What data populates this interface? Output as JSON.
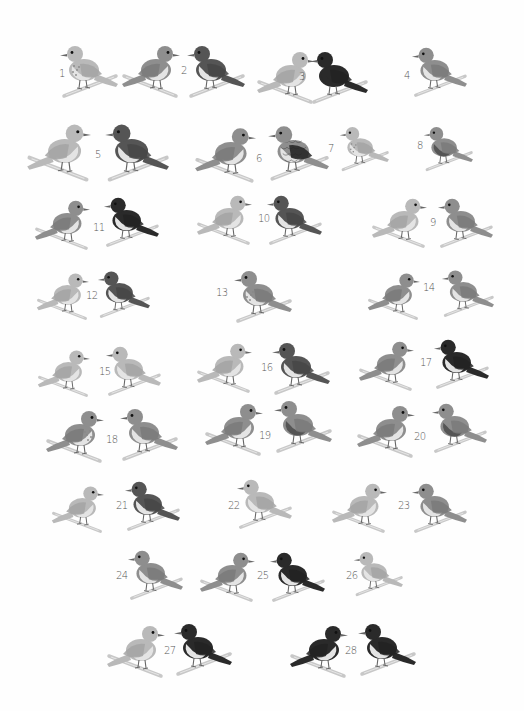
{
  "plate": {
    "description": "Illustration plate of small perching songbirds, numbered 1 to 28, grayscale",
    "background": "#fefefe",
    "shades": {
      "light": "#b9b9b9",
      "mid": "#8e8e8e",
      "dark": "#555555",
      "black": "#2a2a2a",
      "belly": "#e4e4e4",
      "branch": "#c8c8c8"
    }
  },
  "labels": [
    {
      "n": "1",
      "x": 59,
      "y": 68
    },
    {
      "n": "2",
      "x": 181,
      "y": 65
    },
    {
      "n": "3",
      "x": 299,
      "y": 71
    },
    {
      "n": "4",
      "x": 404,
      "y": 70
    },
    {
      "n": "5",
      "x": 95,
      "y": 149
    },
    {
      "n": "6",
      "x": 256,
      "y": 153
    },
    {
      "n": "7",
      "x": 328,
      "y": 143
    },
    {
      "n": "8",
      "x": 417,
      "y": 140
    },
    {
      "n": "9",
      "x": 430,
      "y": 217
    },
    {
      "n": "10",
      "x": 258,
      "y": 213
    },
    {
      "n": "11",
      "x": 93,
      "y": 222
    },
    {
      "n": "12",
      "x": 86,
      "y": 290
    },
    {
      "n": "13",
      "x": 216,
      "y": 287
    },
    {
      "n": "14",
      "x": 423,
      "y": 282
    },
    {
      "n": "15",
      "x": 99,
      "y": 366
    },
    {
      "n": "16",
      "x": 261,
      "y": 362
    },
    {
      "n": "17",
      "x": 420,
      "y": 357
    },
    {
      "n": "18",
      "x": 106,
      "y": 434
    },
    {
      "n": "19",
      "x": 259,
      "y": 430
    },
    {
      "n": "20",
      "x": 414,
      "y": 431
    },
    {
      "n": "21",
      "x": 116,
      "y": 500
    },
    {
      "n": "22",
      "x": 228,
      "y": 500
    },
    {
      "n": "23",
      "x": 398,
      "y": 500
    },
    {
      "n": "24",
      "x": 116,
      "y": 570
    },
    {
      "n": "25",
      "x": 257,
      "y": 570
    },
    {
      "n": "26",
      "x": 346,
      "y": 570
    },
    {
      "n": "27",
      "x": 164,
      "y": 645
    },
    {
      "n": "28",
      "x": 345,
      "y": 645
    }
  ],
  "birds": [
    {
      "id": "1",
      "x": 58,
      "y": 40,
      "dir": "left",
      "body": "light",
      "belly": "spotted",
      "s": 1.0
    },
    {
      "id": "2a",
      "x": 120,
      "y": 40,
      "dir": "right",
      "body": "mid",
      "belly": "pale",
      "s": 1.0
    },
    {
      "id": "2b",
      "x": 185,
      "y": 40,
      "dir": "left",
      "body": "dark",
      "belly": "pale",
      "s": 1.0
    },
    {
      "id": "3a",
      "x": 255,
      "y": 46,
      "dir": "right",
      "body": "light",
      "belly": "pale",
      "s": 1.0
    },
    {
      "id": "3b",
      "x": 308,
      "y": 46,
      "dir": "left",
      "body": "black",
      "belly": "dark",
      "s": 1.0
    },
    {
      "id": "4",
      "x": 410,
      "y": 42,
      "dir": "left",
      "body": "mid",
      "belly": "pale",
      "s": 0.95
    },
    {
      "id": "5a",
      "x": 25,
      "y": 118,
      "dir": "right",
      "body": "light",
      "belly": "pale",
      "s": 1.1
    },
    {
      "id": "5b",
      "x": 103,
      "y": 118,
      "dir": "left",
      "body": "dark",
      "belly": "pale",
      "s": 1.1
    },
    {
      "id": "6a",
      "x": 193,
      "y": 122,
      "dir": "right",
      "body": "mid",
      "belly": "pale",
      "s": 1.05
    },
    {
      "id": "6b",
      "x": 266,
      "y": 120,
      "dir": "left",
      "body": "scaled",
      "belly": "scaled",
      "s": 1.05
    },
    {
      "id": "7",
      "x": 338,
      "y": 122,
      "dir": "left",
      "body": "light",
      "belly": "spotted",
      "s": 0.85
    },
    {
      "id": "8",
      "x": 422,
      "y": 122,
      "dir": "left",
      "body": "mid",
      "belly": "dark",
      "s": 0.85
    },
    {
      "id": "11a",
      "x": 33,
      "y": 195,
      "dir": "right",
      "body": "mid",
      "belly": "pale",
      "s": 0.95
    },
    {
      "id": "11b",
      "x": 102,
      "y": 192,
      "dir": "left",
      "body": "black",
      "belly": "pale",
      "s": 0.95
    },
    {
      "id": "10a",
      "x": 195,
      "y": 190,
      "dir": "right",
      "body": "light",
      "belly": "pale",
      "s": 0.95
    },
    {
      "id": "10b",
      "x": 265,
      "y": 190,
      "dir": "left",
      "body": "dark",
      "belly": "pale",
      "s": 0.95
    },
    {
      "id": "9a",
      "x": 370,
      "y": 193,
      "dir": "right",
      "body": "light",
      "belly": "pale",
      "s": 0.95
    },
    {
      "id": "9b",
      "x": 436,
      "y": 193,
      "dir": "left",
      "body": "mid",
      "belly": "pale",
      "s": 0.95
    },
    {
      "id": "12a",
      "x": 35,
      "y": 268,
      "dir": "right",
      "body": "light",
      "belly": "pale",
      "s": 0.9
    },
    {
      "id": "12b",
      "x": 96,
      "y": 266,
      "dir": "left",
      "body": "dark",
      "belly": "pale",
      "s": 0.9
    },
    {
      "id": "13",
      "x": 232,
      "y": 265,
      "dir": "left",
      "body": "mid",
      "belly": "spotted",
      "s": 1.0
    },
    {
      "id": "14a",
      "x": 366,
      "y": 268,
      "dir": "right",
      "body": "mid",
      "belly": "pale",
      "s": 0.9
    },
    {
      "id": "14b",
      "x": 440,
      "y": 265,
      "dir": "left",
      "body": "mid",
      "belly": "pale",
      "s": 0.9
    },
    {
      "id": "15a",
      "x": 36,
      "y": 345,
      "dir": "right",
      "body": "light",
      "belly": "pale",
      "s": 0.9
    },
    {
      "id": "15b",
      "x": 104,
      "y": 341,
      "dir": "left",
      "body": "light",
      "belly": "pale",
      "s": 0.95
    },
    {
      "id": "16a",
      "x": 195,
      "y": 338,
      "dir": "right",
      "body": "light",
      "belly": "pale",
      "s": 0.95
    },
    {
      "id": "16b",
      "x": 270,
      "y": 337,
      "dir": "left",
      "body": "dark",
      "belly": "pale",
      "s": 1.0
    },
    {
      "id": "17a",
      "x": 357,
      "y": 336,
      "dir": "right",
      "body": "mid",
      "belly": "pale",
      "s": 0.95
    },
    {
      "id": "17b",
      "x": 432,
      "y": 334,
      "dir": "left",
      "body": "black",
      "belly": "pale",
      "s": 0.95
    },
    {
      "id": "18a",
      "x": 44,
      "y": 405,
      "dir": "right",
      "body": "mid",
      "belly": "spotted",
      "s": 1.0
    },
    {
      "id": "18b",
      "x": 118,
      "y": 403,
      "dir": "left",
      "body": "mid",
      "belly": "pale",
      "s": 1.0
    },
    {
      "id": "19a",
      "x": 203,
      "y": 398,
      "dir": "right",
      "body": "mid",
      "belly": "pale",
      "s": 1.0
    },
    {
      "id": "19b",
      "x": 272,
      "y": 395,
      "dir": "left",
      "body": "mid",
      "belly": "dark",
      "s": 1.0
    },
    {
      "id": "20a",
      "x": 355,
      "y": 400,
      "dir": "right",
      "body": "mid",
      "belly": "pale",
      "s": 1.0
    },
    {
      "id": "20b",
      "x": 430,
      "y": 398,
      "dir": "left",
      "body": "mid",
      "belly": "dark",
      "s": 0.95
    },
    {
      "id": "21a",
      "x": 50,
      "y": 481,
      "dir": "right",
      "body": "light",
      "belly": "pale",
      "s": 0.9
    },
    {
      "id": "21b",
      "x": 123,
      "y": 476,
      "dir": "left",
      "body": "dark",
      "belly": "pale",
      "s": 0.95
    },
    {
      "id": "22",
      "x": 235,
      "y": 474,
      "dir": "left",
      "body": "light",
      "belly": "pale",
      "s": 0.95
    },
    {
      "id": "23a",
      "x": 330,
      "y": 478,
      "dir": "right",
      "body": "light",
      "belly": "pale",
      "s": 0.95
    },
    {
      "id": "23b",
      "x": 410,
      "y": 478,
      "dir": "left",
      "body": "mid",
      "belly": "pale",
      "s": 0.95
    },
    {
      "id": "24",
      "x": 126,
      "y": 545,
      "dir": "left",
      "body": "mid",
      "belly": "pale",
      "s": 0.95
    },
    {
      "id": "25a",
      "x": 198,
      "y": 547,
      "dir": "right",
      "body": "mid",
      "belly": "pale",
      "s": 0.95
    },
    {
      "id": "25b",
      "x": 268,
      "y": 547,
      "dir": "left",
      "body": "black",
      "belly": "pale",
      "s": 0.95
    },
    {
      "id": "26",
      "x": 352,
      "y": 547,
      "dir": "left",
      "body": "light",
      "belly": "pale",
      "s": 0.85
    },
    {
      "id": "27a",
      "x": 105,
      "y": 620,
      "dir": "right",
      "body": "light",
      "belly": "pale",
      "s": 1.0
    },
    {
      "id": "27b",
      "x": 172,
      "y": 618,
      "dir": "left",
      "body": "black",
      "belly": "pale",
      "s": 1.0
    },
    {
      "id": "28a",
      "x": 288,
      "y": 620,
      "dir": "right",
      "body": "black",
      "belly": "pale",
      "s": 1.0
    },
    {
      "id": "28b",
      "x": 356,
      "y": 618,
      "dir": "left",
      "body": "black",
      "belly": "pale",
      "s": 1.0
    }
  ]
}
